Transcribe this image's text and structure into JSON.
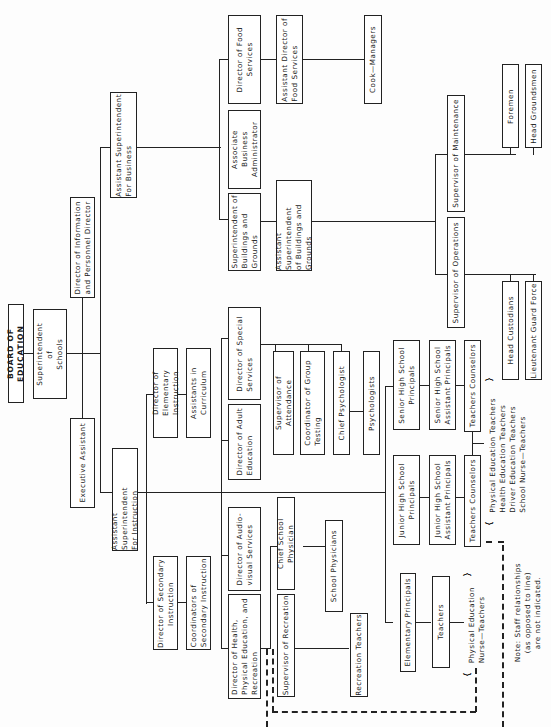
{
  "title": "BOARD OF EDUCATION",
  "top": {
    "superintendent": "Superintendent\nof\nSchools",
    "executive_assistant": "Executive Assistant",
    "director_info_personnel": "Director of Information\nand Personnel Director"
  },
  "business": {
    "asst_supt": "Assistant Superintendent\nFor Business",
    "supt_buildings": "Superintendent of\nBuildings and\nGrounds",
    "assoc_business_admin": "Associate Business\nAdministrator",
    "director_food": "Director of Food\nServices",
    "asst_director_food": "Assistant Director of\nFood Services",
    "cook_managers": "Cook—Managers",
    "asst_supt_buildings": "Assistant Superintendent\nof Buildings and\nGrounds",
    "supervisor_maintenance": "Supervisor of Maintenance",
    "foremen": "Foremen",
    "head_groundsmen": "Head Groundsmen",
    "supervisor_operations": "Supervisor of Operations",
    "head_custodians": "Head Custodians",
    "lieutenant_guard": "Lieutenant Guard Force"
  },
  "instruction": {
    "asst_supt": "Assistant Superintendent\nFor Instruction",
    "director_elementary": "Director of Elementary\nInstruction",
    "assistants_curriculum": "Assistants in Curriculum",
    "director_secondary": "Director of Secondary\nInstruction",
    "coordinators_secondary": "Coordinators of\nSecondary Instruction",
    "director_adult": "Director of Adult\nEducation",
    "director_special": "Director of Special\nServices",
    "supervisor_attendance": "Supervisor of Attendance",
    "coordinator_testing": "Coordinator of Group\nTesting",
    "chief_psychologist": "Chief Psychologist",
    "psychologists": "Psychologists",
    "director_audiovisual": "Director of Audio-\nvisual Services",
    "director_health_pe": "Director of Health,\nPhysical Education, and\nRecreation",
    "chief_school_physician": "Chief School Physician",
    "school_physicians": "School Physicians",
    "supervisor_recreation": "Supervisor of Recreation",
    "recreation_teachers": "Recreation Teachers",
    "senior_hs_principals": "Senior High School\nPrincipals",
    "senior_hs_asst_principals": "Senior High School\nAssistant Principals",
    "senior_teachers_counselors": "Teachers Counselors",
    "junior_hs_principals": "Junior High School\nPrincipals",
    "junior_hs_asst_principals": "Junior High School\nAssistant Principals",
    "junior_teachers_counselors": "Teachers Counselors",
    "secondary_specialists": "Physical Education Teachers\nHealth Education Teachers\nDriver Education Teachers\nSchool Nurse—Teachers",
    "elementary_principals": "Elementary Principals",
    "teachers": "Teachers",
    "elementary_specialists": "Physical Education\nNurse—Teachers"
  },
  "note": "Note: Staff relationships\n(as opposed to line)\nare not indicated."
}
